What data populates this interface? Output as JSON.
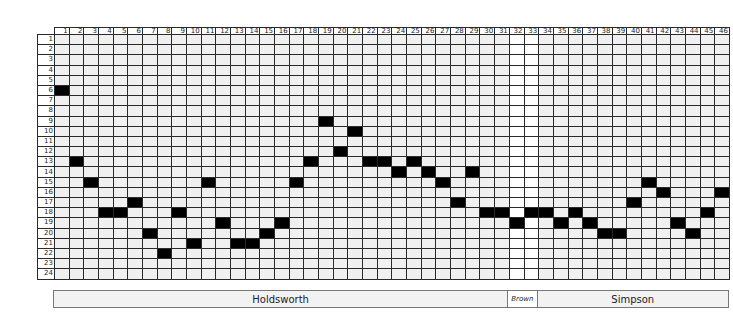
{
  "grid": {
    "columns": 46,
    "rows": 24,
    "column_labels": [
      "1",
      "2",
      "3",
      "4",
      "5",
      "6",
      "7",
      "8",
      "9",
      "10",
      "11",
      "12",
      "13",
      "14",
      "15",
      "16",
      "17",
      "18",
      "19",
      "20",
      "21",
      "22",
      "23",
      "24",
      "25",
      "26",
      "27",
      "28",
      "29",
      "30",
      "31",
      "32",
      "33",
      "34",
      "35",
      "36",
      "37",
      "38",
      "39",
      "40",
      "41",
      "42",
      "43",
      "44",
      "45",
      "46"
    ],
    "row_labels": [
      "1",
      "2",
      "3",
      "4",
      "5",
      "6",
      "7",
      "8",
      "9",
      "10",
      "11",
      "12",
      "13",
      "14",
      "15",
      "16",
      "17",
      "18",
      "19",
      "20",
      "21",
      "22",
      "23",
      "24"
    ],
    "filled_row_by_column": [
      6,
      13,
      15,
      18,
      18,
      17,
      20,
      22,
      18,
      21,
      15,
      19,
      21,
      21,
      20,
      19,
      15,
      13,
      9,
      12,
      10,
      13,
      13,
      14,
      13,
      14,
      15,
      17,
      14,
      18,
      18,
      19,
      18,
      18,
      19,
      18,
      19,
      20,
      20,
      17,
      15,
      16,
      19,
      20,
      18,
      16
    ],
    "white_columns": [
      32,
      33
    ],
    "colors": {
      "cell_bg": "#f0f0f0",
      "highlight_bg": "#ffffff",
      "filled": "#000000",
      "line": "#2a2a2a"
    }
  },
  "segments": [
    {
      "label": "Holdsworth",
      "start_col": 1,
      "end_col": 31
    },
    {
      "label": "Brown",
      "start_col": 32,
      "end_col": 33
    },
    {
      "label": "Simpson",
      "start_col": 34,
      "end_col": 46
    }
  ]
}
